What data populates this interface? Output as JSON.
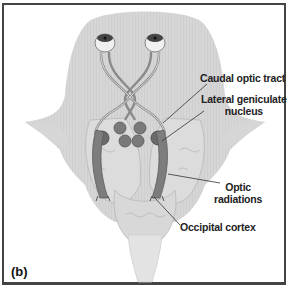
{
  "figure": {
    "panel_label": "(b)",
    "labels": {
      "caudal_optic_tract": "Caudal optic tract",
      "lateral_geniculate_line1": "Lateral geniculate",
      "lateral_geniculate_line2": "nucleus",
      "optic_radiations_line1": "Optic",
      "optic_radiations_line2": "radiations",
      "occipital_cortex": "Occipital cortex"
    },
    "colors": {
      "brain_fill": "#d9d9d9",
      "tract": "#8a8a8a",
      "nucleus": "#6e6e6e",
      "radiation": "#7a7a7a",
      "border": "#444444"
    }
  }
}
